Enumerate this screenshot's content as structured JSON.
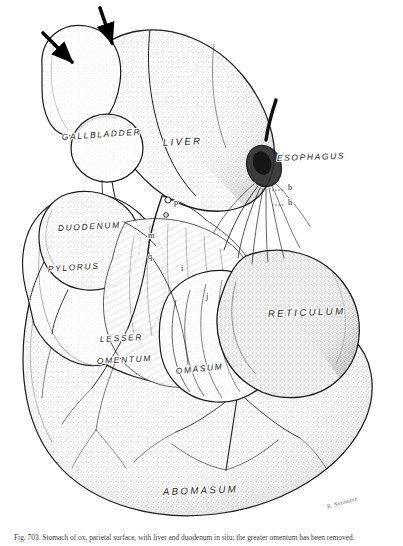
{
  "figure": {
    "background_color": "#ffffff",
    "ink_color": "#1a1a1a",
    "caption_prefix": "Fig. 703.",
    "caption_text": "Fig. 703. Stomach of ox, parietal surface, with liver and duodenum in situ; the greater omentum has been removed."
  },
  "organ_labels": [
    {
      "key": "gallbladder",
      "text": "GALLBLADDER",
      "x": 62,
      "y": 140,
      "size": "md",
      "rotate": -4
    },
    {
      "key": "liver",
      "text": "LIVER",
      "x": 163,
      "y": 146,
      "size": "lg",
      "rotate": -3
    },
    {
      "key": "esophagus",
      "text": "ESOPHAGUS",
      "x": 277,
      "y": 161,
      "size": "md",
      "rotate": -2
    },
    {
      "key": "duodenum",
      "text": "DUODENUM",
      "x": 58,
      "y": 231,
      "size": "md",
      "rotate": -3
    },
    {
      "key": "pylorus",
      "text": "PYLORUS",
      "x": 48,
      "y": 272,
      "size": "md",
      "rotate": -4
    },
    {
      "key": "lesser",
      "text": "LESSER",
      "x": 100,
      "y": 342,
      "size": "md",
      "rotate": -3
    },
    {
      "key": "omentum",
      "text": "OMENTUM",
      "x": 97,
      "y": 364,
      "size": "md",
      "rotate": -3
    },
    {
      "key": "omasum",
      "text": "OMASUM",
      "x": 176,
      "y": 374,
      "size": "md",
      "rotate": -6
    },
    {
      "key": "reticulum",
      "text": "RETICULUM",
      "x": 268,
      "y": 317,
      "size": "lg",
      "rotate": -2
    },
    {
      "key": "abomasum",
      "text": "ABOMASUM",
      "x": 163,
      "y": 495,
      "size": "lg",
      "rotate": -2
    }
  ],
  "letter_callouts": [
    {
      "key": "b",
      "text": "b",
      "x": 288,
      "y": 190
    },
    {
      "key": "h",
      "text": "h",
      "x": 288,
      "y": 205
    },
    {
      "key": "p",
      "text": "p",
      "x": 174,
      "y": 205
    },
    {
      "key": "m",
      "text": "m",
      "x": 148,
      "y": 238
    },
    {
      "key": "q",
      "text": "q",
      "x": 148,
      "y": 259
    },
    {
      "key": "i",
      "text": "i",
      "x": 181,
      "y": 271
    },
    {
      "key": "j",
      "text": "j",
      "x": 206,
      "y": 299
    }
  ],
  "arrows": [
    {
      "key": "arrow-left",
      "x1": 43,
      "y1": 33,
      "x2": 72,
      "y2": 62
    },
    {
      "key": "arrow-right",
      "x1": 100,
      "y1": 8,
      "x2": 112,
      "y2": 43
    }
  ],
  "signature": {
    "text": "R. Neumann",
    "x": 358,
    "y": 500
  }
}
